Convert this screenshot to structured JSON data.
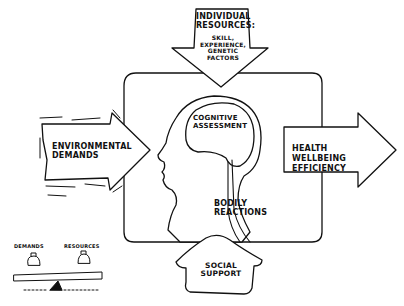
{
  "diagram": {
    "individual_resources": {
      "title_line1": "INDIVIDUAL",
      "title_line2": "RESOURCES:",
      "detail_line1": "SKILL,",
      "detail_line2": "EXPERIENCE,",
      "detail_line3": "GENETIC",
      "detail_line4": "FACTORS"
    },
    "environmental_demands": {
      "line1": "ENVIRONMENTAL",
      "line2": "DEMANDS"
    },
    "cognitive_assessment": {
      "line1": "COGNITIVE",
      "line2": "ASSESSMENT"
    },
    "bodily_reactions": {
      "line1": "BODILY",
      "line2": "REACTIONS"
    },
    "outcome": {
      "line1": "HEALTH",
      "line2": "WELLBEING",
      "line3": "EFFICIENCY"
    },
    "social_support": {
      "line1": "SOCIAL",
      "line2": "SUPPORT"
    },
    "balance": {
      "left_label": "DEMANDS",
      "right_label": "RESOURCES"
    }
  }
}
